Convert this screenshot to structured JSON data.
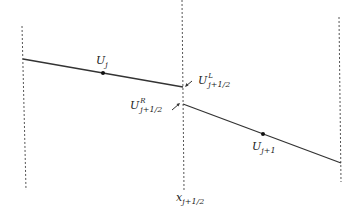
{
  "diagram": {
    "type": "piecewise-linear reconstruction",
    "labels": {
      "u_j": {
        "base": "U",
        "sub": "j"
      },
      "u_jp1": {
        "base": "U",
        "sub": "j+1"
      },
      "u_left": {
        "base": "U",
        "sup": "L",
        "sub": "j+1/2"
      },
      "u_right": {
        "base": "U",
        "sup": "R",
        "sub": "j+1/2"
      },
      "x_interface": {
        "base": "x",
        "sub": "j+1/2"
      }
    },
    "colors": {
      "line": "#333333",
      "dotted": "#555555",
      "text": "#222222"
    }
  }
}
